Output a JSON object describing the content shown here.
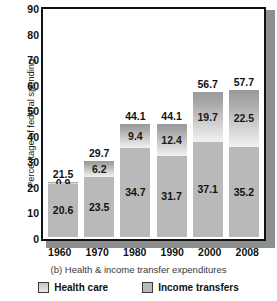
{
  "chart_data": {
    "type": "bar",
    "subtype": "stacked-bar",
    "title": "",
    "caption": "(b) Health & income transfer expenditures",
    "xlabel": "",
    "ylabel": "Percentage of federal spending",
    "ylim": [
      0,
      90
    ],
    "ytick_step": 10,
    "yticks": [
      90,
      80,
      70,
      60,
      50,
      40,
      30,
      20,
      10,
      0
    ],
    "grid": false,
    "legend_position": "bottom",
    "categories": [
      "1960",
      "1970",
      "1980",
      "1990",
      "2000",
      "2008"
    ],
    "series": [
      {
        "name": "Income transfers",
        "stack_position": "bottom",
        "color": "#b9b9b9",
        "values": [
          20.6,
          23.5,
          34.7,
          31.7,
          37.1,
          35.2
        ]
      },
      {
        "name": "Health care",
        "stack_position": "top",
        "color": "#cfcfcf",
        "values": [
          0.9,
          6.2,
          9.4,
          12.4,
          19.7,
          22.5
        ]
      }
    ],
    "totals": [
      21.5,
      29.7,
      44.1,
      44.1,
      56.7,
      57.7
    ],
    "total_labels": [
      "21.5",
      "29.7",
      "44.1",
      "44.1",
      "56.7",
      "57.7"
    ]
  },
  "legend": {
    "items": [
      {
        "label": "Health care",
        "swatch": "health-care-swatch"
      },
      {
        "label": "Income transfers",
        "swatch": "income-transfers-swatch"
      }
    ]
  }
}
